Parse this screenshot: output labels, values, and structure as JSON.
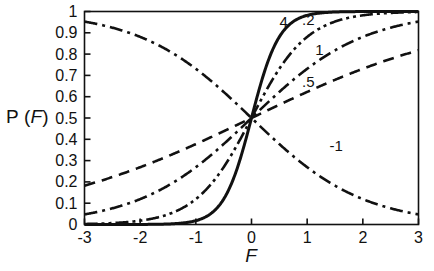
{
  "chart_data": {
    "type": "line",
    "title": "",
    "xlabel": "F",
    "ylabel": "P (F)",
    "ylabel_parts": {
      "prefix": "P (",
      "italic": "F",
      "suffix": ")"
    },
    "xlim": [
      -3,
      3
    ],
    "ylim": [
      0,
      1
    ],
    "grid": false,
    "legend": "inline-curve-labels",
    "xticks": [
      -3,
      -2,
      -1,
      0,
      1,
      2,
      3
    ],
    "xtick_labels": [
      "-3",
      "-2",
      "-1",
      "0",
      "1",
      "2",
      "3"
    ],
    "yticks": [
      0,
      0.1,
      0.2,
      0.3,
      0.4,
      0.5,
      0.6,
      0.7,
      0.8,
      0.9,
      1
    ],
    "ytick_labels": [
      "0",
      "0.1",
      "0.2",
      "0.3",
      "0.4",
      "0.5",
      "0.6",
      "0.7",
      "0.8",
      "0.9",
      "1"
    ],
    "x": [
      -3,
      -2.75,
      -2.5,
      -2.25,
      -2,
      -1.75,
      -1.5,
      -1.25,
      -1,
      -0.75,
      -0.5,
      -0.25,
      0,
      0.25,
      0.5,
      0.75,
      1,
      1.25,
      1.5,
      1.75,
      2,
      2.25,
      2.5,
      2.75,
      3
    ],
    "series": [
      {
        "name": "4",
        "label": ".5",
        "slope": 0.5,
        "dash": "dashed",
        "width": 2.6,
        "color": "#111111",
        "label_x": 1.02,
        "label_y": 0.645,
        "values": [
          0.1824,
          0.2014,
          0.2219,
          0.2438,
          0.2689,
          0.2942,
          0.3208,
          0.3486,
          0.3775,
          0.4075,
          0.4378,
          0.4688,
          0.5,
          0.5312,
          0.5622,
          0.5925,
          0.6225,
          0.6514,
          0.6792,
          0.7058,
          0.7311,
          0.7549,
          0.7773,
          0.7981,
          0.8176
        ]
      },
      {
        "name": "1",
        "label": "1",
        "slope": 1.0,
        "dash": "dashdot",
        "width": 2.6,
        "color": "#111111",
        "label_x": 1.22,
        "label_y": 0.795,
        "values": [
          0.0474,
          0.0601,
          0.0759,
          0.0952,
          0.1192,
          0.148,
          0.1824,
          0.2227,
          0.2689,
          0.3208,
          0.3775,
          0.4378,
          0.5,
          0.5622,
          0.6225,
          0.6792,
          0.7311,
          0.7773,
          0.8176,
          0.852,
          0.8808,
          0.9046,
          0.9241,
          0.9399,
          0.9526
        ]
      },
      {
        "name": "2",
        "label": ".2",
        "slope": 2.0,
        "dash": "dashdotdot",
        "width": 2.6,
        "color": "#111111",
        "label_x": 1.02,
        "label_y": 0.935,
        "values": [
          0.0025,
          0.0041,
          0.0067,
          0.011,
          0.018,
          0.0293,
          0.0474,
          0.0759,
          0.1192,
          0.1824,
          0.2689,
          0.3775,
          0.5,
          0.6225,
          0.7311,
          0.8176,
          0.8808,
          0.9241,
          0.9526,
          0.9707,
          0.982,
          0.989,
          0.9933,
          0.9959,
          0.9975
        ]
      },
      {
        "name": "4-steep",
        "label": "4",
        "slope": 4.0,
        "dash": "solid",
        "width": 3.0,
        "color": "#111111",
        "label_x": 0.58,
        "label_y": 0.925,
        "values": [
          6e-06,
          1.7e-05,
          4.5e-05,
          0.00012,
          0.00034,
          0.00091,
          0.0025,
          0.0067,
          0.018,
          0.0474,
          0.1192,
          0.2689,
          0.5,
          0.7311,
          0.8808,
          0.9526,
          0.982,
          0.9933,
          0.9975,
          0.9991,
          0.99966,
          0.99988,
          0.99995,
          0.99998,
          0.999994
        ]
      },
      {
        "name": "-1",
        "label": "-1",
        "slope": -1.0,
        "dash": "dashdot",
        "width": 2.6,
        "color": "#111111",
        "label_x": 1.52,
        "label_y": 0.345,
        "values": [
          0.9526,
          0.9399,
          0.9241,
          0.9046,
          0.8808,
          0.852,
          0.8176,
          0.7773,
          0.7311,
          0.6792,
          0.6225,
          0.5622,
          0.5,
          0.4378,
          0.3775,
          0.3208,
          0.2689,
          0.2227,
          0.1824,
          0.148,
          0.1192,
          0.0952,
          0.0759,
          0.0601,
          0.0474
        ]
      }
    ]
  },
  "figure": {
    "background": "#ffffff",
    "axis_color": "#111111"
  }
}
